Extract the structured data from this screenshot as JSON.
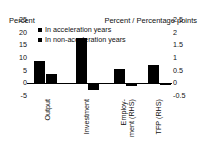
{
  "chart_data": {
    "type": "bar",
    "title": "",
    "subtitle": "",
    "xlabel": "",
    "ylabel": "Percent",
    "ylabel_right": "Percent / Percentage points",
    "categories": [
      "Output",
      "Investment",
      "Employ-\nment (RHS)",
      "TFP (RHS)"
    ],
    "series": [
      {
        "name": "In acceleration years",
        "values": [
          9,
          18,
          0.55,
          0.72
        ],
        "color": "#000000"
      },
      {
        "name": "In non-acceleration years",
        "values": [
          3.5,
          -2.5,
          -0.12,
          -0.08
        ],
        "color": "#000000"
      }
    ],
    "axis_assignment": [
      "left",
      "left",
      "right",
      "right"
    ],
    "ylim": [
      -5,
      25
    ],
    "ylim_right": [
      -0.5,
      2.5
    ],
    "yticks": [
      "25",
      "20",
      "15",
      "10",
      "5",
      "0",
      "-5"
    ],
    "yticks_right": [
      "2.5",
      "2",
      "1.5",
      "1",
      "0.5",
      "0",
      "-0.5"
    ],
    "grid": false,
    "legend_position": "top-left"
  },
  "axes": {
    "left_title": "Percent",
    "right_title": "Percent / Percentage points"
  },
  "legend": {
    "items": [
      {
        "label": "In acceleration years",
        "swatch": "legend-swatch-square"
      },
      {
        "label": "In non-acceleration years",
        "swatch": "legend-swatch-square"
      }
    ]
  },
  "ticks": {
    "left": [
      "25",
      "20",
      "15",
      "10",
      "5",
      "0",
      "-5"
    ],
    "right": [
      "2.5",
      "2",
      "1.5",
      "1",
      "0.5",
      "0",
      "-0.5"
    ]
  },
  "categories": {
    "labels": [
      "Output",
      "Investment",
      "Employ-\nment (RHS)",
      "TFP (RHS)"
    ]
  }
}
